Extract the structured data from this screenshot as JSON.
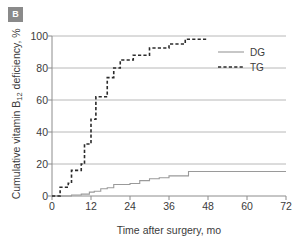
{
  "panel": {
    "label": "B"
  },
  "colors": {
    "dg": "#9a9a9a",
    "tg": "#2b2b2b",
    "grid": "#b8b8b8",
    "axis": "#8c8c8c",
    "text": "#3b3b3b",
    "badge_bg": "#8a8a8a",
    "badge_text": "#ffffff"
  },
  "chart_data": {
    "type": "line",
    "title": "",
    "subtitle": "",
    "xlabel": "Time after surgery, mo",
    "ylabel": "Cumulative vitamin B12 deficiency, %",
    "ylabel_parts": {
      "pre": "Cumulative vitamin B",
      "sub": "12",
      "post": " deficiency, %"
    },
    "xlim": [
      0,
      72
    ],
    "ylim": [
      0,
      100
    ],
    "xticks": [
      0,
      12,
      24,
      36,
      48,
      60,
      72
    ],
    "yticks": [
      0,
      20,
      40,
      60,
      80,
      100
    ],
    "gridlines_y": [
      20,
      40,
      60,
      80,
      100
    ],
    "grid": "horizontal",
    "legend_position": "top-right",
    "legend": [
      {
        "name": "DG",
        "style": "solid",
        "color": "#9a9a9a"
      },
      {
        "name": "TG",
        "style": "dashed",
        "color": "#2b2b2b"
      }
    ],
    "series": [
      {
        "name": "DG",
        "style": "solid",
        "color": "#9a9a9a",
        "step": "post",
        "points": [
          [
            0,
            0
          ],
          [
            6,
            0
          ],
          [
            6,
            0.6
          ],
          [
            9,
            0.6
          ],
          [
            9,
            1.2
          ],
          [
            11.5,
            1.2
          ],
          [
            11.5,
            2.4
          ],
          [
            13,
            2.4
          ],
          [
            13,
            3.0
          ],
          [
            15,
            3.0
          ],
          [
            15,
            4.5
          ],
          [
            17,
            4.5
          ],
          [
            17,
            5.2
          ],
          [
            19,
            5.2
          ],
          [
            19,
            7.2
          ],
          [
            24,
            7.2
          ],
          [
            24,
            7.8
          ],
          [
            27,
            7.8
          ],
          [
            27,
            9.6
          ],
          [
            30,
            9.6
          ],
          [
            30,
            10.8
          ],
          [
            33,
            10.8
          ],
          [
            33,
            11.4
          ],
          [
            36,
            11.4
          ],
          [
            36,
            12.6
          ],
          [
            42,
            12.6
          ],
          [
            42,
            15.3
          ],
          [
            72,
            15.3
          ]
        ]
      },
      {
        "name": "TG",
        "style": "dashed",
        "color": "#2b2b2b",
        "step": "post",
        "points": [
          [
            0,
            0
          ],
          [
            2.5,
            0
          ],
          [
            2.5,
            5.5
          ],
          [
            5,
            5.5
          ],
          [
            5,
            8.0
          ],
          [
            6,
            8.0
          ],
          [
            6,
            16.0
          ],
          [
            9,
            16.0
          ],
          [
            9,
            20.0
          ],
          [
            10,
            20.0
          ],
          [
            10,
            32.5
          ],
          [
            12,
            32.5
          ],
          [
            12,
            48.0
          ],
          [
            13.5,
            48.0
          ],
          [
            13.5,
            62.0
          ],
          [
            17,
            62.0
          ],
          [
            17,
            74.0
          ],
          [
            19,
            74.0
          ],
          [
            19,
            80.0
          ],
          [
            21,
            80.0
          ],
          [
            21,
            85.0
          ],
          [
            25,
            85.0
          ],
          [
            25,
            88.0
          ],
          [
            30,
            88.0
          ],
          [
            30,
            92.5
          ],
          [
            36,
            92.5
          ],
          [
            36,
            95.0
          ],
          [
            41,
            95.0
          ],
          [
            41,
            98.0
          ],
          [
            48,
            98.0
          ]
        ]
      }
    ]
  }
}
